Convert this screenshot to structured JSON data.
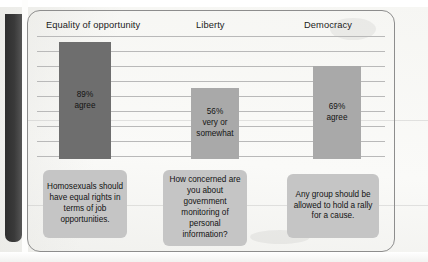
{
  "figure": {
    "columns": [
      {
        "header": "Equality of opportunity",
        "bar_label": "89%\nagree",
        "value": 89,
        "value_text": "89%",
        "qualifier": "agree",
        "bar_color": "#6e6e6e",
        "caption": "Homosexuals should have equal rights in terms of job opportunities."
      },
      {
        "header": "Liberty",
        "bar_label": "56%\nvery or\nsomewhat",
        "value": 56,
        "value_text": "56%",
        "qualifier": "very or somewhat",
        "bar_color": "#a9a9a9",
        "caption": "How concerned are you about government monitoring of personal information?"
      },
      {
        "header": "Democracy",
        "bar_label": "69%\nagree",
        "value": 69,
        "value_text": "69%",
        "qualifier": "agree",
        "bar_color": "#a9a9a9",
        "caption": "Any group should be allowed to hold a rally for a cause."
      }
    ]
  },
  "chart_data": {
    "type": "bar",
    "title": "",
    "xlabel": "",
    "ylabel": "",
    "categories": [
      "Equality of opportunity",
      "Liberty",
      "Democracy"
    ],
    "values": [
      89,
      56,
      69
    ],
    "value_labels": [
      "89% agree",
      "56% very or somewhat",
      "69% agree"
    ],
    "bar_colors": [
      "#6e6e6e",
      "#a9a9a9",
      "#a9a9a9"
    ],
    "ylim": [
      0,
      100
    ],
    "grid": true,
    "gridlines": 9,
    "legend": "none",
    "annotations": [
      "Homosexuals should have equal rights in terms of job opportunities.",
      "How concerned are you about government monitoring of personal information?",
      "Any group should be allowed to hold a rally for a cause."
    ]
  },
  "colors": {
    "bar_dark": "#6e6e6e",
    "bar_light": "#a9a9a9",
    "caption_fill": "#c5c5c5",
    "gridline": "#b9b9b9",
    "frame": "#8d8d8d",
    "page": "#f7f7f5"
  }
}
